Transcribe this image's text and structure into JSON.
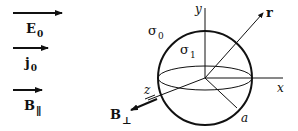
{
  "legend": {
    "items": [
      {
        "symbol": "E",
        "subscript": "0",
        "name": "applied electric field"
      },
      {
        "symbol": "j",
        "subscript": "0",
        "name": "current density"
      },
      {
        "symbol": "B",
        "subscript": "∥",
        "name": "parallel magnetic field"
      }
    ]
  },
  "sphere": {
    "inner_conductivity": {
      "symbol": "σ",
      "subscript": "1"
    },
    "outer_conductivity": {
      "symbol": "σ",
      "subscript": "0"
    },
    "radius_label": "a"
  },
  "axes": {
    "x": "x",
    "y": "y",
    "z": "z"
  },
  "position_vector": "r",
  "perpendicular_field": {
    "symbol": "B",
    "subscript": "⊥"
  },
  "colors": {
    "stroke": "#111111",
    "background": "#ffffff"
  }
}
